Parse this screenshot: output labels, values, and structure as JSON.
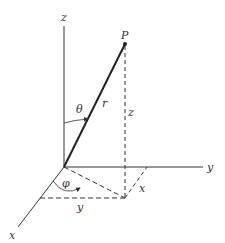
{
  "diagram": {
    "labels": {
      "z_axis": "z",
      "y_axis": "y",
      "x_axis": "x",
      "point": "P",
      "radius": "r",
      "theta": "θ",
      "phi": "φ",
      "z_height": "z",
      "x_proj": "x",
      "y_proj": "y"
    },
    "colors": {
      "line": "#333333",
      "background": "#ffffff"
    }
  }
}
